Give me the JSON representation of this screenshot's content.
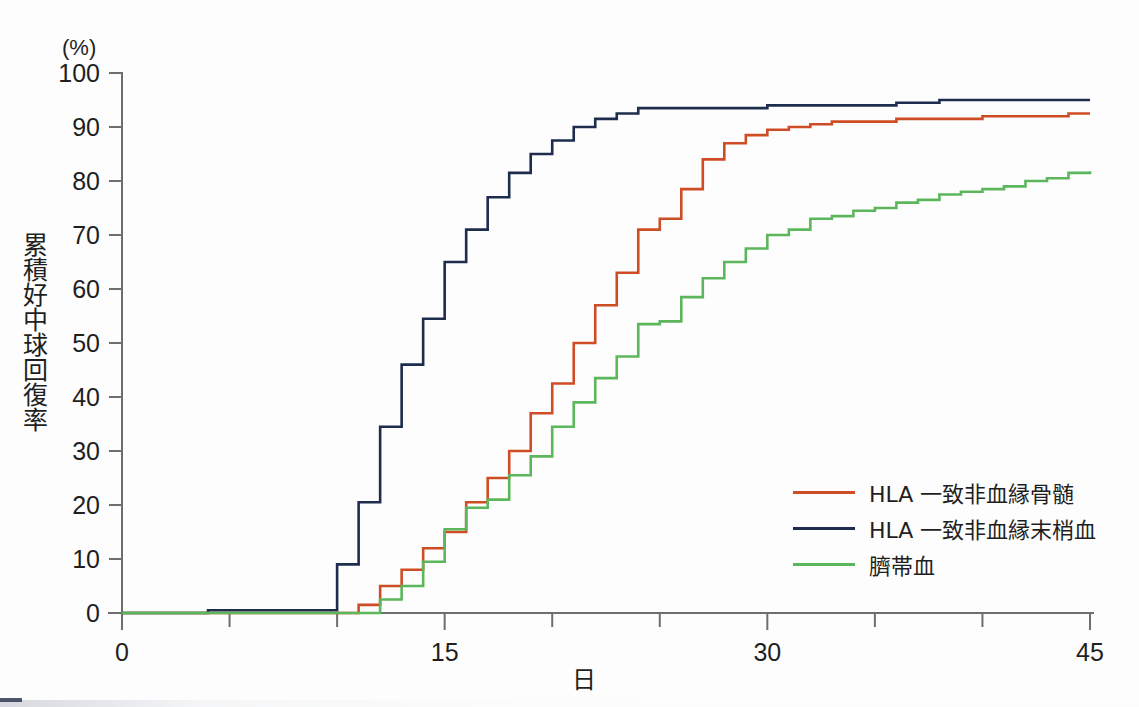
{
  "figure": {
    "unit_label": "(%)",
    "y_axis_title": "累積好中球回復率",
    "x_axis_title": "日"
  },
  "legend": {
    "position": "right-middle",
    "items": [
      {
        "label": "HLA 一致非血縁骨髄",
        "color": "#cf4d25",
        "name": "legend-item-bone-marrow"
      },
      {
        "label": "HLA 一致非血縁末梢血",
        "color": "#1e2d4d",
        "name": "legend-item-peripheral-blood"
      },
      {
        "label": "臍帯血",
        "color": "#5cb75c",
        "name": "legend-item-cord-blood"
      }
    ]
  },
  "chart_data": {
    "type": "line",
    "title": "",
    "subtitle": "",
    "xlabel": "日",
    "ylabel": "累積好中球回復率",
    "y_unit": "(%)",
    "xlim": [
      0,
      45
    ],
    "ylim": [
      0,
      100
    ],
    "x_ticks": [
      0,
      15,
      30,
      45
    ],
    "x_tick_labels": [
      "0",
      "15",
      "30",
      "45"
    ],
    "x_minor_ticks": [
      5,
      10,
      20,
      25,
      35,
      40
    ],
    "y_ticks": [
      0,
      10,
      20,
      30,
      40,
      50,
      60,
      70,
      80,
      90,
      100
    ],
    "y_tick_labels": [
      "0",
      "10",
      "20",
      "30",
      "40",
      "50",
      "60",
      "70",
      "80",
      "90",
      "100"
    ],
    "grid": false,
    "step_style": "post",
    "legend_position": "right-middle",
    "series": [
      {
        "name": "HLA 一致非血縁骨髄",
        "color": "#cf4d25",
        "x": [
          0,
          10,
          11,
          12,
          13,
          14,
          15,
          16,
          17,
          18,
          19,
          20,
          21,
          22,
          23,
          24,
          25,
          26,
          27,
          28,
          29,
          30,
          31,
          32,
          33,
          34,
          35,
          36,
          37,
          38,
          40,
          42,
          44,
          45
        ],
        "values": [
          0,
          0,
          1.5,
          5,
          8,
          12,
          15,
          20.5,
          25,
          30,
          37,
          42.5,
          50,
          57,
          63,
          71,
          73,
          78.5,
          84,
          87,
          88.5,
          89.5,
          90,
          90.5,
          91,
          91,
          91,
          91.5,
          91.5,
          91.5,
          92,
          92,
          92.5,
          92.5
        ]
      },
      {
        "name": "HLA 一致非血縁末梢血",
        "color": "#1e2d4d",
        "x": [
          0,
          4,
          9,
          10,
          11,
          12,
          13,
          14,
          15,
          16,
          17,
          18,
          19,
          20,
          21,
          22,
          23,
          24,
          26,
          28,
          30,
          32,
          34,
          36,
          38,
          45
        ],
        "values": [
          0,
          0.5,
          0.5,
          9,
          20.5,
          34.5,
          46,
          54.5,
          65,
          71,
          77,
          81.5,
          85,
          87.5,
          90,
          91.5,
          92.5,
          93.5,
          93.5,
          93.5,
          94,
          94,
          94,
          94.5,
          95,
          95
        ]
      },
      {
        "name": "臍帯血",
        "color": "#5cb75c",
        "x": [
          0,
          11,
          12,
          13,
          14,
          15,
          16,
          17,
          18,
          19,
          20,
          21,
          22,
          23,
          24,
          25,
          26,
          27,
          28,
          29,
          30,
          31,
          32,
          33,
          34,
          35,
          36,
          37,
          38,
          39,
          40,
          41,
          42,
          43,
          44,
          45
        ],
        "values": [
          0,
          0,
          2.5,
          5,
          9.5,
          15.5,
          19.5,
          21,
          25.5,
          29,
          34.5,
          39,
          43.5,
          47.5,
          53.5,
          54,
          58.5,
          62,
          65,
          67.5,
          70,
          71,
          73,
          73.5,
          74.5,
          75,
          76,
          76.5,
          77.5,
          78,
          78.5,
          79,
          80,
          80.5,
          81.5,
          81.8
        ]
      }
    ]
  }
}
